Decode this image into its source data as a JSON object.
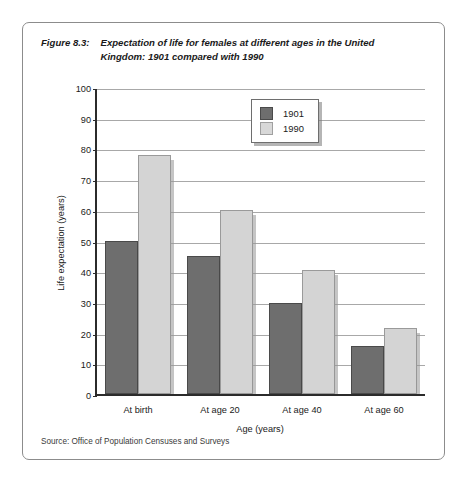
{
  "figure": {
    "label": "Figure 8.3:",
    "title": "Expectation of life for females at different ages in the United Kingdom: 1901 compared with 1990",
    "source": "Source: Office of Population Censuses and Surveys"
  },
  "colors": {
    "series_1901": "#6e6e6e",
    "series_1990": "#d4d4d4",
    "axis": "#2b2b2b",
    "grid": "#a8a8a8",
    "border": "#8c8c8c"
  },
  "chart_data": {
    "type": "bar",
    "title": "Expectation of life for females at different ages in the United Kingdom: 1901 compared with 1990",
    "xlabel": "Age (years)",
    "ylabel": "Life expectation (years)",
    "categories": [
      "At birth",
      "At age 20",
      "At age 40",
      "At age 60"
    ],
    "series": [
      {
        "name": "1901",
        "values": [
          50,
          45,
          29.5,
          15.5
        ]
      },
      {
        "name": "1990",
        "values": [
          78,
          60,
          40.5,
          21.5
        ]
      }
    ],
    "ylim": [
      0,
      100
    ],
    "yticks": [
      0,
      10,
      20,
      30,
      40,
      50,
      60,
      70,
      80,
      90,
      100
    ],
    "grid": true,
    "legend_position": "top-center"
  }
}
